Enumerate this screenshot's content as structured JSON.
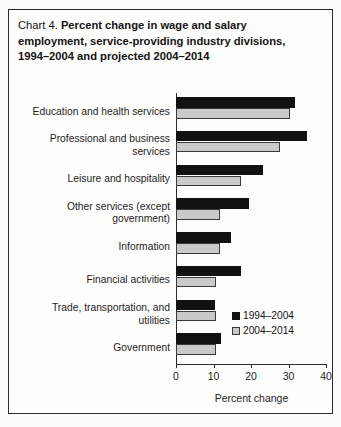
{
  "figure": {
    "label": "Chart 4.",
    "title": "Percent change in wage and salary employment, service-providing industry divisions, 1994–2004 and projected 2004–2014"
  },
  "legend": {
    "position": "inside-bottom-right",
    "entries": [
      {
        "name": "1994–2004",
        "color": "#111111"
      },
      {
        "name": "2004–2014",
        "color": "#c9c9c9"
      }
    ]
  },
  "axis": {
    "x_title": "Percent change",
    "ticks": [
      "0",
      "10",
      "20",
      "30",
      "40"
    ]
  },
  "chart_data": {
    "type": "bar",
    "orientation": "horizontal",
    "title": "Chart 4. Percent change in wage and salary employment, service-providing industry divisions, 1994–2004 and projected 2004–2014",
    "xlabel": "Percent change",
    "ylabel": "",
    "xlim": [
      0,
      40
    ],
    "xticks": [
      0,
      10,
      20,
      30,
      40
    ],
    "grid": false,
    "legend_position": "lower right",
    "categories": [
      "Education and health services",
      "Professional and business services",
      "Leisure and hospitality",
      "Other services (except government)",
      "Information",
      "Financial activities",
      "Trade, transportation, and utilities",
      "Government"
    ],
    "series": [
      {
        "name": "1994–2004",
        "color": "#111111",
        "values": [
          31.7,
          35.0,
          23.2,
          19.5,
          14.7,
          17.3,
          10.3,
          12.0
        ]
      },
      {
        "name": "2004–2014",
        "color": "#c9c9c9",
        "values": [
          30.4,
          27.8,
          17.3,
          11.7,
          11.7,
          10.7,
          10.7,
          10.7
        ]
      }
    ]
  }
}
